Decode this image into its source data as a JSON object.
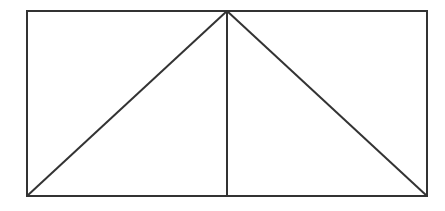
{
  "diagram": {
    "canvas": {
      "width": 445,
      "height": 211,
      "background": "#ffffff"
    },
    "stroke": {
      "color": "#333333",
      "width": 2
    },
    "rectangle": {
      "x1": 27,
      "y1": 11,
      "x2": 427,
      "y2": 196
    },
    "apex": {
      "x": 227,
      "y": 11
    },
    "midline": {
      "x": 227,
      "y1": 11,
      "y2": 196
    },
    "diagonals": [
      {
        "from": {
          "x": 27,
          "y": 196
        },
        "to": {
          "x": 227,
          "y": 11
        }
      },
      {
        "from": {
          "x": 227,
          "y": 11
        },
        "to": {
          "x": 427,
          "y": 196
        }
      }
    ]
  }
}
